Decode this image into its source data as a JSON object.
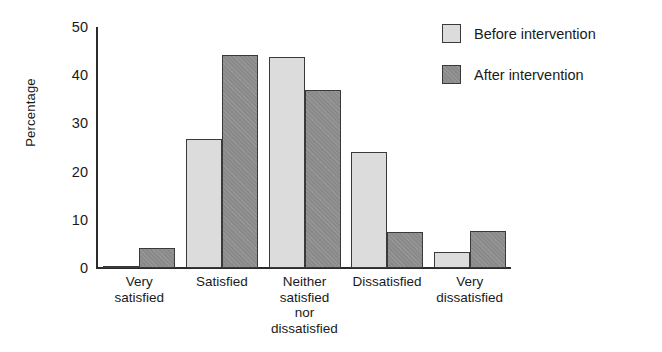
{
  "chart_data": {
    "type": "bar",
    "title": "",
    "xlabel": "",
    "ylabel": "Percentage",
    "ylim": [
      0,
      50
    ],
    "yticks": [
      0,
      10,
      20,
      30,
      40,
      50
    ],
    "grid": false,
    "legend_position": "top-right",
    "categories": [
      "Very satisfied",
      "Satisfied",
      "Neither satisfied nor dissatisfied",
      "Dissatisfied",
      "Very dissatisfied"
    ],
    "category_lines": [
      [
        "Very",
        "satisfied"
      ],
      [
        "Satisfied"
      ],
      [
        "Neither",
        "satisfied",
        "nor",
        "dissatisfied"
      ],
      [
        "Dissatisfied"
      ],
      [
        "Very",
        "dissatisfied"
      ]
    ],
    "series": [
      {
        "name": "Before intervention",
        "color": "#dcdcdc",
        "values": [
          0.5,
          26.8,
          43.7,
          24.0,
          3.4
        ]
      },
      {
        "name": "After intervention",
        "color": "#8a8a8a",
        "values": [
          4.1,
          44.2,
          37.0,
          7.4,
          7.6
        ]
      }
    ]
  },
  "legend": {
    "items": [
      {
        "label": "Before intervention"
      },
      {
        "label": "After intervention"
      }
    ]
  },
  "colors": {
    "before": "#dcdcdc",
    "after": "#8a8a8a",
    "axis": "#2b2b2b",
    "bar_border": "#3a3a3a",
    "background": "#ffffff"
  }
}
